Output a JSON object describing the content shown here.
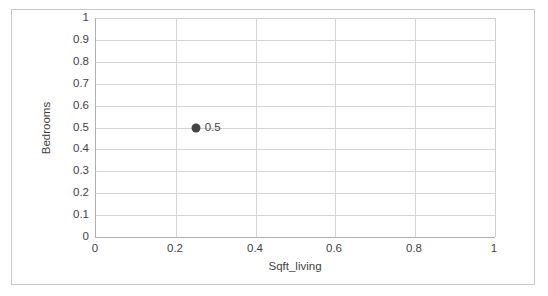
{
  "chart_data": {
    "type": "scatter",
    "title": "",
    "xlabel": "Sqft_living",
    "ylabel": "Bedrooms",
    "xlim": [
      0,
      1
    ],
    "ylim": [
      0,
      1
    ],
    "grid": true,
    "legend": false,
    "x_ticks": [
      "0",
      "0.2",
      "0.4",
      "0.6",
      "0.8",
      "1"
    ],
    "x_tick_values": [
      0,
      0.2,
      0.4,
      0.6,
      0.8,
      1
    ],
    "y_ticks": [
      "1",
      "0.9",
      "0.8",
      "0.7",
      "0.6",
      "0.5",
      "0.4",
      "0.3",
      "0.2",
      "0.1",
      "0"
    ],
    "y_tick_values": [
      1,
      0.9,
      0.8,
      0.7,
      0.6,
      0.5,
      0.4,
      0.3,
      0.2,
      0.1,
      0
    ],
    "series": [
      {
        "name": "",
        "marker_color": "#454545",
        "points": [
          {
            "x": 0.25,
            "y": 0.5,
            "label": "0.5"
          }
        ]
      }
    ]
  },
  "colors": {
    "marker": "#454545",
    "gridline": "#d4d4d4",
    "axis_line": "#b0b0b0",
    "frame_border": "#c8c8c8",
    "text": "#3f3f3f",
    "background": "#ffffff"
  }
}
